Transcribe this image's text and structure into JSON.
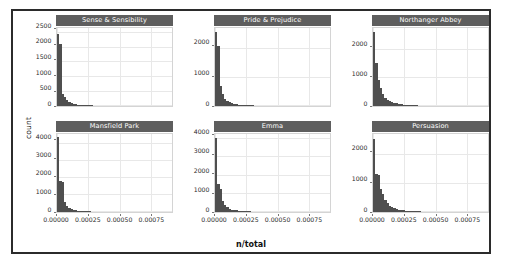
{
  "figure": {
    "xlabel": "n/total",
    "ylabel": "count"
  },
  "chart_data": {
    "type": "bar",
    "title": "",
    "subtitle": "",
    "xlabel": "n/total",
    "ylabel": "count",
    "grid": true,
    "legend": "none",
    "layout": {
      "rows": 2,
      "cols": 3,
      "scales": "free_y",
      "shared_x": true
    },
    "xlim": [
      0,
      0.00092
    ],
    "xticks": [
      0,
      0.00025,
      0.0005,
      0.00075
    ],
    "xticklabels": [
      "0.00000",
      "0.00025",
      "0.00050",
      "0.00075"
    ],
    "bin_width": 1.82e-05,
    "panels": [
      {
        "row": 0,
        "col": 0,
        "title": "Sense & Sensibility",
        "ylim": [
          0,
          2650
        ],
        "yticks": [
          0,
          500,
          1000,
          1500,
          2000,
          2500
        ],
        "yticklabels": [
          "0",
          "500",
          "1000",
          "1500",
          "2000",
          "2500"
        ],
        "bin_centers": [
          9.1e-06,
          2.73e-05,
          4.55e-05,
          6.36e-05,
          8.18e-05,
          0.0001,
          0.0001182,
          0.0001364,
          0.0001545,
          0.0001727,
          0.0001909,
          0.0002091,
          0.0002273,
          0.0002455,
          0.0002636,
          0.0002818,
          0.0003,
          0.0003182,
          0.0003364,
          0.0003545,
          0.0003727,
          0.0003909,
          0.0004091,
          0.0004273,
          0.0004455,
          0.0004636,
          0.0004818,
          0.0005,
          0.0005182,
          0.0005364,
          0.0005545,
          0.0005727,
          0.0005909,
          0.0006091,
          0.0006273,
          0.0006455,
          0.0006636,
          0.0006818,
          0.0007,
          0.0007182,
          0.0007364,
          0.0007545,
          0.0007727,
          0.0007909,
          0.0008091,
          0.0008273,
          0.0008455,
          0.0008636,
          0.0008818,
          0.0009
        ],
        "counts": [
          2430,
          2110,
          420,
          300,
          190,
          130,
          95,
          75,
          60,
          48,
          40,
          34,
          28,
          24,
          21,
          18,
          16,
          14,
          12,
          11,
          10,
          9,
          8,
          8,
          7,
          6,
          6,
          5,
          5,
          4,
          4,
          4,
          3,
          3,
          3,
          3,
          2,
          2,
          2,
          2,
          2,
          2,
          1,
          1,
          1,
          1,
          1,
          1,
          1,
          1
        ]
      },
      {
        "row": 0,
        "col": 1,
        "title": "Pride & Prejudice",
        "ylim": [
          0,
          2700
        ],
        "yticks": [
          0,
          1000,
          2000
        ],
        "yticklabels": [
          "0",
          "1000",
          "2000"
        ],
        "bin_centers": [
          9.1e-06,
          2.73e-05,
          4.55e-05,
          6.36e-05,
          8.18e-05,
          0.0001,
          0.0001182,
          0.0001364,
          0.0001545,
          0.0001727,
          0.0001909,
          0.0002091,
          0.0002273,
          0.0002455,
          0.0002636,
          0.0002818,
          0.0003,
          0.0003182,
          0.0003364,
          0.0003545,
          0.0003727,
          0.0003909,
          0.0004091,
          0.0004273,
          0.0004455,
          0.0004636,
          0.0004818,
          0.0005,
          0.0005182,
          0.0005364,
          0.0005545,
          0.0005727,
          0.0005909,
          0.0006091,
          0.0006273,
          0.0006455,
          0.0006636,
          0.0006818,
          0.0007,
          0.0007182,
          0.0007364,
          0.0007545,
          0.0007727,
          0.0007909,
          0.0008091,
          0.0008273,
          0.0008455,
          0.0008636,
          0.0008818,
          0.0009
        ],
        "counts": [
          2560,
          2080,
          700,
          400,
          260,
          175,
          125,
          95,
          75,
          60,
          50,
          42,
          36,
          30,
          26,
          22,
          19,
          17,
          15,
          13,
          12,
          11,
          10,
          9,
          8,
          7,
          7,
          6,
          6,
          5,
          5,
          4,
          4,
          4,
          3,
          3,
          3,
          3,
          2,
          2,
          2,
          2,
          2,
          1,
          1,
          1,
          1,
          1,
          1,
          1
        ]
      },
      {
        "row": 0,
        "col": 2,
        "title": "Northanger Abbey",
        "ylim": [
          0,
          2750
        ],
        "yticks": [
          0,
          1000,
          2000
        ],
        "yticklabels": [
          "0",
          "1000",
          "2000"
        ],
        "bin_centers": [
          9.1e-06,
          2.73e-05,
          4.55e-05,
          6.36e-05,
          8.18e-05,
          0.0001,
          0.0001182,
          0.0001364,
          0.0001545,
          0.0001727,
          0.0001909,
          0.0002091,
          0.0002273,
          0.0002455,
          0.0002636,
          0.0002818,
          0.0003,
          0.0003182,
          0.0003364,
          0.0003545,
          0.0003727,
          0.0003909,
          0.0004091,
          0.0004273,
          0.0004455,
          0.0004636,
          0.0004818,
          0.0005,
          0.0005182,
          0.0005364,
          0.0005545,
          0.0005727,
          0.0005909,
          0.0006091,
          0.0006273,
          0.0006455,
          0.0006636,
          0.0006818,
          0.0007,
          0.0007182,
          0.0007364,
          0.0007545,
          0.0007727,
          0.0007909,
          0.0008091,
          0.0008273,
          0.0008455,
          0.0008636,
          0.0008818,
          0.0009
        ],
        "counts": [
          2600,
          1500,
          900,
          620,
          420,
          300,
          225,
          175,
          140,
          110,
          90,
          72,
          60,
          50,
          42,
          36,
          30,
          26,
          23,
          20,
          18,
          16,
          14,
          13,
          11,
          10,
          9,
          8,
          8,
          7,
          6,
          6,
          5,
          5,
          4,
          4,
          4,
          3,
          3,
          3,
          2,
          2,
          2,
          2,
          2,
          1,
          1,
          1,
          1,
          1
        ]
      },
      {
        "row": 1,
        "col": 0,
        "title": "Mansfield Park",
        "ylim": [
          0,
          4550
        ],
        "yticks": [
          0,
          1000,
          2000,
          3000,
          4000
        ],
        "yticklabels": [
          "0",
          "1000",
          "2000",
          "3000",
          "4000"
        ],
        "bin_centers": [
          9.1e-06,
          2.73e-05,
          4.55e-05,
          6.36e-05,
          8.18e-05,
          0.0001,
          0.0001182,
          0.0001364,
          0.0001545,
          0.0001727,
          0.0001909,
          0.0002091,
          0.0002273,
          0.0002455,
          0.0002636,
          0.0002818,
          0.0003,
          0.0003182,
          0.0003364,
          0.0003545,
          0.0003727,
          0.0003909,
          0.0004091,
          0.0004273,
          0.0004455,
          0.0004636,
          0.0004818,
          0.0005,
          0.0005182,
          0.0005364,
          0.0005545,
          0.0005727,
          0.0005909,
          0.0006091,
          0.0006273,
          0.0006455,
          0.0006636,
          0.0006818,
          0.0007,
          0.0007182,
          0.0007364,
          0.0007545,
          0.0007727,
          0.0007909,
          0.0008091,
          0.0008273,
          0.0008455,
          0.0008636,
          0.0008818,
          0.0009
        ],
        "counts": [
          4380,
          1800,
          1780,
          600,
          380,
          250,
          175,
          130,
          100,
          80,
          65,
          54,
          45,
          38,
          32,
          27,
          24,
          21,
          18,
          16,
          14,
          13,
          11,
          10,
          9,
          8,
          8,
          7,
          6,
          6,
          5,
          5,
          4,
          4,
          4,
          3,
          3,
          3,
          2,
          2,
          2,
          2,
          2,
          1,
          1,
          1,
          1,
          1,
          1,
          1
        ]
      },
      {
        "row": 1,
        "col": 1,
        "title": "Emma",
        "ylim": [
          0,
          4250
        ],
        "yticks": [
          0,
          1000,
          2000,
          3000,
          4000
        ],
        "yticklabels": [
          "0",
          "1000",
          "2000",
          "3000",
          "4000"
        ],
        "bin_centers": [
          9.1e-06,
          2.73e-05,
          4.55e-05,
          6.36e-05,
          8.18e-05,
          0.0001,
          0.0001182,
          0.0001364,
          0.0001545,
          0.0001727,
          0.0001909,
          0.0002091,
          0.0002273,
          0.0002455,
          0.0002636,
          0.0002818,
          0.0003,
          0.0003182,
          0.0003364,
          0.0003545,
          0.0003727,
          0.0003909,
          0.0004091,
          0.0004273,
          0.0004455,
          0.0004636,
          0.0004818,
          0.0005,
          0.0005182,
          0.0005364,
          0.0005545,
          0.0005727,
          0.0005909,
          0.0006091,
          0.0006273,
          0.0006455,
          0.0006636,
          0.0006818,
          0.0007,
          0.0007182,
          0.0007364,
          0.0007545,
          0.0007727,
          0.0007909,
          0.0008091,
          0.0008273,
          0.0008455,
          0.0008636,
          0.0008818,
          0.0009
        ],
        "counts": [
          4050,
          1500,
          1250,
          600,
          380,
          250,
          180,
          135,
          105,
          85,
          70,
          58,
          48,
          40,
          34,
          29,
          25,
          22,
          19,
          17,
          15,
          13,
          12,
          11,
          10,
          9,
          8,
          7,
          7,
          6,
          5,
          5,
          5,
          4,
          4,
          3,
          3,
          3,
          3,
          2,
          2,
          2,
          2,
          2,
          1,
          1,
          1,
          1,
          1,
          1
        ]
      },
      {
        "row": 1,
        "col": 2,
        "title": "Persuasion",
        "ylim": [
          0,
          2700
        ],
        "yticks": [
          0,
          1000,
          2000
        ],
        "yticklabels": [
          "0",
          "1000",
          "2000"
        ],
        "bin_centers": [
          9.1e-06,
          2.73e-05,
          4.55e-05,
          6.36e-05,
          8.18e-05,
          0.0001,
          0.0001182,
          0.0001364,
          0.0001545,
          0.0001727,
          0.0001909,
          0.0002091,
          0.0002273,
          0.0002455,
          0.0002636,
          0.0002818,
          0.0003,
          0.0003182,
          0.0003364,
          0.0003545,
          0.0003727,
          0.0003909,
          0.0004091,
          0.0004273,
          0.0004455,
          0.0004636,
          0.0004818,
          0.0005,
          0.0005182,
          0.0005364,
          0.0005545,
          0.0005727,
          0.0005909,
          0.0006091,
          0.0006273,
          0.0006455,
          0.0006636,
          0.0006818,
          0.0007,
          0.0007182,
          0.0007364,
          0.0007545,
          0.0007727,
          0.0007909,
          0.0008091,
          0.0008273,
          0.0008455,
          0.0008636,
          0.0008818,
          0.0009
        ],
        "counts": [
          2520,
          1300,
          1280,
          800,
          620,
          420,
          300,
          210,
          160,
          125,
          100,
          82,
          68,
          56,
          47,
          40,
          34,
          29,
          25,
          22,
          19,
          17,
          15,
          13,
          12,
          11,
          10,
          9,
          8,
          7,
          6,
          6,
          5,
          5,
          4,
          4,
          3,
          3,
          3,
          3,
          2,
          2,
          2,
          2,
          1,
          1,
          1,
          1,
          1,
          1
        ]
      }
    ]
  }
}
